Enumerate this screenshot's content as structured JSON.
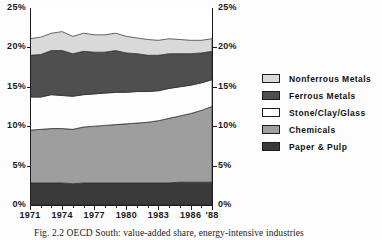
{
  "chart_data": {
    "type": "area",
    "title": "",
    "xlabel": "",
    "ylabel": "",
    "stacked": true,
    "grid": false,
    "legend_position": "right",
    "xlim": [
      1971,
      1988
    ],
    "ylim": [
      0,
      25
    ],
    "x": [
      1971,
      1972,
      1973,
      1974,
      1975,
      1976,
      1977,
      1978,
      1979,
      1980,
      1981,
      1982,
      1983,
      1984,
      1985,
      1986,
      1987,
      1988
    ],
    "x_tick_labels": [
      "1971",
      "1974",
      "1977",
      "1980",
      "1983",
      "1986",
      "'88"
    ],
    "x_tick_values": [
      1971,
      1974,
      1977,
      1980,
      1983,
      1986,
      1988
    ],
    "y_tick_labels": [
      "0%",
      "5%",
      "10%",
      "15%",
      "20%",
      "25%"
    ],
    "y_tick_values": [
      0,
      5,
      10,
      15,
      20,
      25
    ],
    "y_axis_right_labels": [
      "0%",
      "5%",
      "10%",
      "15%",
      "20%",
      "25%"
    ],
    "series": [
      {
        "name": "Paper & Pulp",
        "color": "#3a3a3a",
        "values": [
          2.8,
          2.8,
          2.8,
          2.8,
          2.7,
          2.8,
          2.8,
          2.8,
          2.8,
          2.8,
          2.8,
          2.8,
          2.8,
          2.8,
          2.9,
          2.9,
          2.9,
          2.9
        ]
      },
      {
        "name": "Chemicals",
        "color": "#9e9e9e",
        "values": [
          6.7,
          6.8,
          6.9,
          6.9,
          6.9,
          7.1,
          7.2,
          7.3,
          7.4,
          7.5,
          7.6,
          7.7,
          7.9,
          8.2,
          8.4,
          8.7,
          9.1,
          9.6
        ]
      },
      {
        "name": "Stone/Clay/Glass",
        "color": "#fdfdfd",
        "values": [
          4.2,
          4.1,
          4.3,
          4.2,
          4.2,
          4.1,
          4.1,
          4.1,
          4.1,
          4.0,
          4.0,
          3.9,
          3.8,
          3.8,
          3.7,
          3.6,
          3.5,
          3.4
        ]
      },
      {
        "name": "Ferrous Metals",
        "color": "#4f4f4f",
        "values": [
          5.3,
          5.4,
          5.6,
          5.7,
          5.4,
          5.5,
          5.3,
          5.2,
          5.3,
          5.0,
          4.8,
          4.6,
          4.5,
          4.4,
          4.2,
          4.0,
          3.8,
          3.6
        ]
      },
      {
        "name": "Nonferrous Metals",
        "color": "#d9d9d9",
        "values": [
          2.1,
          2.2,
          2.2,
          2.4,
          2.2,
          2.3,
          2.2,
          2.2,
          2.2,
          2.1,
          2.0,
          2.0,
          1.9,
          1.9,
          1.8,
          1.7,
          1.6,
          1.6
        ]
      }
    ],
    "cumulative_top_percent": [
      21.1,
      21.3,
      21.8,
      22.0,
      21.4,
      21.8,
      21.6,
      21.6,
      21.8,
      21.4,
      21.2,
      21.0,
      20.9,
      21.1,
      21.0,
      20.9,
      20.9,
      21.1
    ]
  },
  "legend": {
    "items": [
      {
        "label": "Nonferrous Metals",
        "swatch": "#d9d9d9"
      },
      {
        "label": "Ferrous Metals",
        "swatch": "#4f4f4f"
      },
      {
        "label": "Stone/Clay/Glass",
        "swatch": "#ffffff"
      },
      {
        "label": "Chemicals",
        "swatch": "#9e9e9e"
      },
      {
        "label": "Paper & Pulp",
        "swatch": "#3a3a3a"
      }
    ]
  },
  "caption": {
    "text": "Fig. 2.2  OECD South: value-added share, energy-intensive industries"
  }
}
